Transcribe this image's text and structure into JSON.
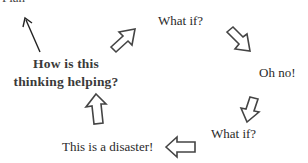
{
  "diagram": {
    "type": "cycle",
    "stroke_color": "#444444",
    "background": "#ffffff",
    "top_cut_text": "Plan",
    "nodes": [
      {
        "id": "what-if-1",
        "label": "What if?"
      },
      {
        "id": "oh-no",
        "label": "Oh no!"
      },
      {
        "id": "what-if-2",
        "label": "What if?"
      },
      {
        "id": "disaster",
        "label": "This is a disaster!"
      }
    ],
    "center_question": {
      "line1": "How is this",
      "line2": "thinking helping?"
    },
    "arrows": [
      {
        "from": "disaster",
        "to": "center_question",
        "direction": "up"
      },
      {
        "from": "center_question",
        "to": "what-if-1",
        "direction": "up-right"
      },
      {
        "from": "what-if-1",
        "to": "oh-no",
        "direction": "down-right"
      },
      {
        "from": "oh-no",
        "to": "what-if-2",
        "direction": "down-left"
      },
      {
        "from": "what-if-2",
        "to": "disaster",
        "direction": "left"
      },
      {
        "from": "center_question",
        "to": "top_cut_text",
        "direction": "up-left",
        "style": "thin-line"
      }
    ]
  }
}
